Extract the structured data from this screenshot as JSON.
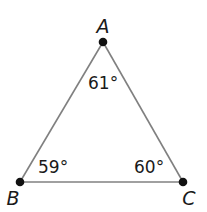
{
  "diagram": {
    "type": "triangle",
    "vertices": [
      {
        "id": "A",
        "label": "A",
        "x": 103,
        "y": 42,
        "label_x": 103,
        "label_y": 33
      },
      {
        "id": "B",
        "label": "B",
        "x": 20,
        "y": 182,
        "label_x": 13,
        "label_y": 205
      },
      {
        "id": "C",
        "label": "C",
        "x": 183,
        "y": 182,
        "label_x": 189,
        "label_y": 205
      }
    ],
    "angles": [
      {
        "vertex": "A",
        "value": "61°",
        "x": 88,
        "y": 89
      },
      {
        "vertex": "B",
        "value": "59°",
        "x": 38,
        "y": 173
      },
      {
        "vertex": "C",
        "value": "60°",
        "x": 134,
        "y": 173
      }
    ],
    "colors": {
      "edge": "#808080",
      "point": "#111111"
    }
  }
}
